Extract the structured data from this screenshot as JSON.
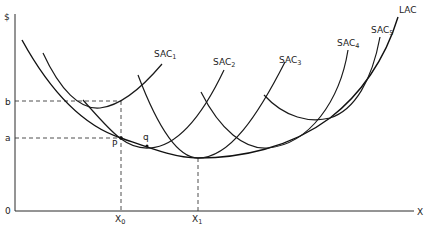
{
  "axes": {
    "y_label": "$",
    "x_label": "X",
    "origin_label": "0",
    "y_ticks": [
      {
        "label": "b"
      },
      {
        "label": "a"
      }
    ],
    "x_ticks": [
      {
        "base": "X",
        "sub": "0"
      },
      {
        "base": "X",
        "sub": "1"
      }
    ]
  },
  "curves": {
    "lac": {
      "label": "LAC"
    },
    "sac": [
      {
        "base": "SAC",
        "sub": "1"
      },
      {
        "base": "SAC",
        "sub": "2"
      },
      {
        "base": "SAC",
        "sub": "3"
      },
      {
        "base": "SAC",
        "sub": "4"
      },
      {
        "base": "SAC",
        "sub": "5"
      }
    ]
  },
  "points": {
    "p": {
      "label": "P"
    },
    "q": {
      "label": "q"
    }
  }
}
